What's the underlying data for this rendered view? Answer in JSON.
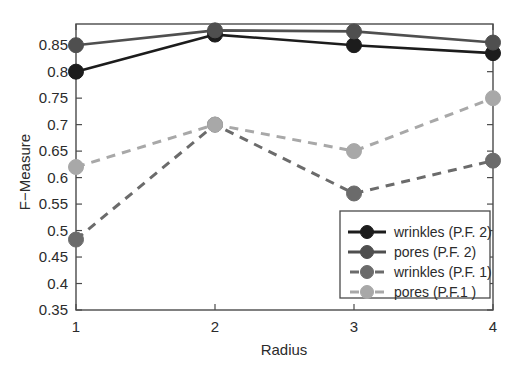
{
  "chart_data": {
    "type": "line",
    "title": "",
    "xlabel": "Radius",
    "ylabel": "F−Measure",
    "x": [
      1,
      2,
      3,
      4
    ],
    "xticklabels": [
      "1",
      "2",
      "3",
      "4"
    ],
    "yticklabels": [
      "0.35",
      "0.4",
      "0.45",
      "0.5",
      "0.55",
      "0.6",
      "0.65",
      "0.7",
      "0.75",
      "0.8",
      "0.85"
    ],
    "ytickvalues": [
      0.35,
      0.4,
      0.45,
      0.5,
      0.55,
      0.6,
      0.65,
      0.7,
      0.75,
      0.8,
      0.85
    ],
    "xlim": [
      1,
      4
    ],
    "ylim": [
      0.35,
      0.89
    ],
    "grid": false,
    "legend_position": "lower right",
    "series": [
      {
        "name": "wrinkles (P.F. 2)",
        "values": [
          0.8,
          0.87,
          0.85,
          0.835
        ],
        "color": "#1c1c1c",
        "linestyle": "solid",
        "marker": "circle"
      },
      {
        "name": "pores (P.F. 2)",
        "values": [
          0.85,
          0.878,
          0.876,
          0.855
        ],
        "color": "#4f4f4f",
        "linestyle": "solid",
        "marker": "circle"
      },
      {
        "name": "wrinkles (P.F. 1)",
        "values": [
          0.483,
          0.7,
          0.57,
          0.632
        ],
        "color": "#6b6b6b",
        "linestyle": "dashed",
        "marker": "circle"
      },
      {
        "name": "pores (P.F.1 )",
        "values": [
          0.62,
          0.7,
          0.65,
          0.75
        ],
        "color": "#a8a8a8",
        "linestyle": "dashed",
        "marker": "circle"
      }
    ]
  },
  "axes": {
    "x_title": "Radius",
    "y_title": "F−Measure"
  },
  "legend": {
    "entries": [
      {
        "label": "wrinkles (P.F. 2)"
      },
      {
        "label": "pores (P.F. 2)"
      },
      {
        "label": "wrinkles (P.F. 1)"
      },
      {
        "label": "pores (P.F.1 )"
      }
    ]
  }
}
